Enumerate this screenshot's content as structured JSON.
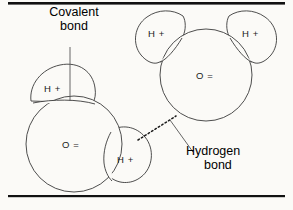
{
  "figure": {
    "background_color": "#fbfaf7",
    "ink_color": "#3a3a3a",
    "rule_color": "#111111"
  },
  "callouts": {
    "covalent": {
      "line1": "Covalent",
      "line2": "bond"
    },
    "hydrogen": {
      "line1": "Hydrogen",
      "line2": "bond"
    }
  },
  "molecules": {
    "left": {
      "oxygen_label": "O =",
      "hydrogens": [
        {
          "label": "H +",
          "position": "top"
        },
        {
          "label": "H +",
          "position": "right"
        }
      ]
    },
    "right": {
      "oxygen_label": "O =",
      "hydrogens": [
        {
          "label": "H +",
          "position": "upper-left"
        },
        {
          "label": "H +",
          "position": "upper-right"
        }
      ]
    }
  },
  "bonds": {
    "hydrogen_bond_style": "dashed"
  }
}
